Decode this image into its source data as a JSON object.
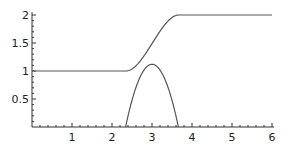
{
  "chart_data": {
    "type": "line",
    "title": "",
    "xlabel": "",
    "ylabel": "",
    "xlim": [
      0,
      6.05
    ],
    "ylim": [
      0,
      2.05
    ],
    "grid": false,
    "legend": null,
    "x_ticks": [
      1,
      2,
      3,
      4,
      5,
      6
    ],
    "x_tick_labels": [
      "1",
      "2",
      "3",
      "4",
      "5",
      "6"
    ],
    "y_ticks": [
      0.5,
      1,
      1.5,
      2
    ],
    "y_tick_labels": [
      "0.5",
      "1",
      "1.5",
      "2"
    ],
    "series": [
      {
        "name": "smooth step",
        "color": "#555555",
        "x": [
          0,
          0.5,
          1,
          1.5,
          2,
          2.35,
          2.5,
          2.75,
          3.0,
          3.25,
          3.5,
          3.67,
          4,
          4.5,
          5,
          5.5,
          6
        ],
        "y": [
          1,
          1,
          1,
          1,
          1,
          1,
          1.04,
          1.26,
          1.5,
          1.74,
          1.96,
          2,
          2,
          2,
          2,
          2,
          2
        ]
      },
      {
        "name": "bump",
        "color": "#555555",
        "x": [
          2.34,
          2.5,
          2.75,
          3.0,
          3.25,
          3.5,
          3.66
        ],
        "y": [
          0,
          0.52,
          0.96,
          1.12,
          0.96,
          0.52,
          0
        ]
      }
    ]
  },
  "axes": {
    "x_tick_labels": [
      "1",
      "2",
      "3",
      "4",
      "5",
      "6"
    ],
    "y_tick_labels": [
      "0.5",
      "1",
      "1.5",
      "2"
    ]
  }
}
